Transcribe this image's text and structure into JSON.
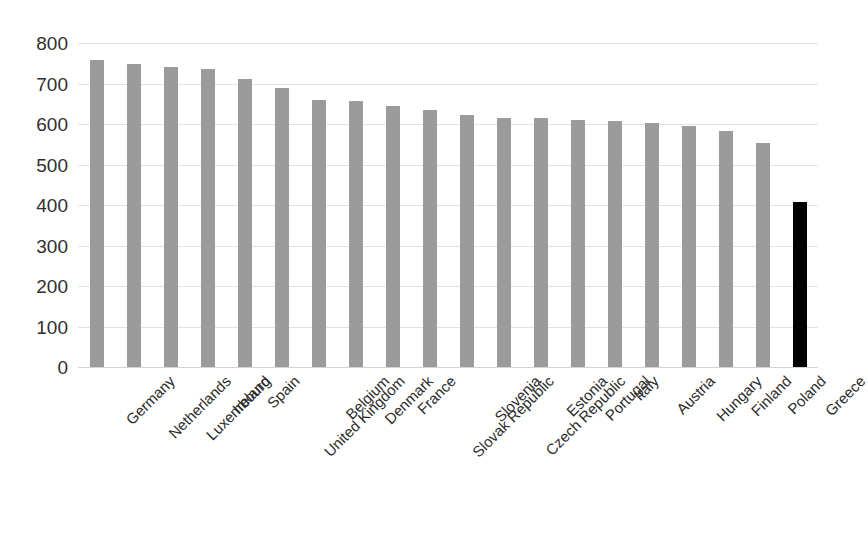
{
  "chart_data": {
    "type": "bar",
    "title": "",
    "subtitle": "",
    "xlabel": "",
    "ylabel": "",
    "ylim": [
      0,
      800
    ],
    "y_ticks": [
      0,
      100,
      200,
      300,
      400,
      500,
      600,
      700,
      800
    ],
    "grid": true,
    "legend": false,
    "legend_position": "none",
    "orientation": "vertical",
    "categories": [
      "Germany",
      "Netherlands",
      "Luxembourg",
      "Ireland",
      "Spain",
      "United Kingdom",
      "Belgium",
      "Denmark",
      "France",
      "Slovak Republic",
      "Slovenia",
      "Czech Republic",
      "Estonia",
      "Portugal",
      "Italy",
      "Austria",
      "Hungary",
      "Finland",
      "Poland",
      "Greece"
    ],
    "values": [
      758,
      748,
      741,
      736,
      712,
      688,
      659,
      658,
      645,
      635,
      623,
      616,
      615,
      610,
      608,
      602,
      596,
      583,
      552,
      408
    ],
    "bar_colors": [
      "#9b9b9b",
      "#9b9b9b",
      "#9b9b9b",
      "#9b9b9b",
      "#9b9b9b",
      "#9b9b9b",
      "#9b9b9b",
      "#9b9b9b",
      "#9b9b9b",
      "#9b9b9b",
      "#9b9b9b",
      "#9b9b9b",
      "#9b9b9b",
      "#9b9b9b",
      "#9b9b9b",
      "#9b9b9b",
      "#9b9b9b",
      "#9b9b9b",
      "#9b9b9b",
      "#000000"
    ],
    "highlight_category": "Greece",
    "colors": {
      "bar_default": "#9b9b9b",
      "bar_highlight": "#000000",
      "gridline": "#e2e2e2",
      "baseline": "#d4d4d4",
      "text": "#2f2f2f",
      "background": "#ffffff"
    }
  }
}
